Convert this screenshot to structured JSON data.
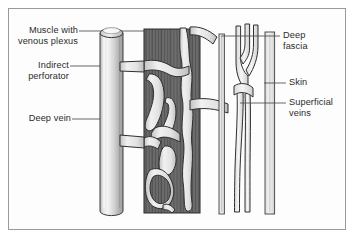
{
  "figure": {
    "type": "anatomical-diagram",
    "background_color": "#ffffff",
    "border_color": "#9a9a9a",
    "ink_color": "#2b2b2b"
  },
  "labels": {
    "muscle_venous_plexus": "Muscle with\nvenous plexus",
    "indirect_perforator": "Indirect\nperforator",
    "deep_vein": "Deep vein",
    "deep_fascia": "Deep\nfascia",
    "skin": "Skin",
    "superficial_veins": "Superficial\nveins"
  },
  "structures": {
    "deep_vein": {
      "name": "deep vein",
      "shape": "cylinder",
      "fill_light": "#f2f2f2",
      "fill_mid": "#c9c9c9",
      "fill_dark": "#a8a8a8",
      "outline": "#3a3a3a"
    },
    "muscle": {
      "name": "muscle with venous plexus",
      "shape": "striated block",
      "fill": "#6e6e6e",
      "striation_color": "#3d3d3d",
      "outline": "#2f2f2f"
    },
    "venous_plexus": {
      "name": "venous plexus channels",
      "fill": "#e8e8e8",
      "outline": "#333333"
    },
    "indirect_perforator": {
      "name": "indirect perforator vein",
      "fill": "#e8e8e8",
      "outline": "#333333"
    },
    "deep_fascia": {
      "name": "deep fascia",
      "shape": "paired vertical lines",
      "fill": "#f0f0f0",
      "outline": "#4a4a4a"
    },
    "superficial_veins": {
      "name": "superficial veins",
      "shape": "branching vessel",
      "fill": "#ececec",
      "outline": "#333333"
    },
    "skin": {
      "name": "skin",
      "shape": "vertical band",
      "fill": "#f4f4f4",
      "outline": "#4a4a4a"
    }
  }
}
